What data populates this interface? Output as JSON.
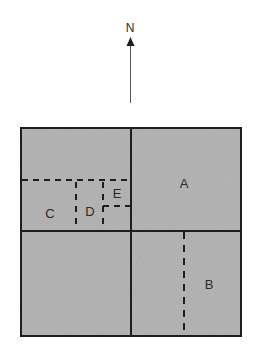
{
  "diagram": {
    "north_indicator": {
      "label": "N",
      "icon": "north-arrow-icon"
    },
    "colors": {
      "fill": "#b9b9b9",
      "line": "#1e1e1e",
      "text": "#2a2a2a"
    },
    "regions": [
      {
        "id": "A",
        "label": "A"
      },
      {
        "id": "B",
        "label": "B"
      },
      {
        "id": "C",
        "label": "C"
      },
      {
        "id": "D",
        "label": "D"
      },
      {
        "id": "E",
        "label": "E"
      }
    ]
  }
}
